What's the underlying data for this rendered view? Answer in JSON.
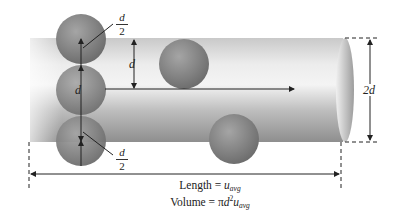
{
  "diagram": {
    "labels": {
      "d_half_top_num": "d",
      "d_half_top_den": "2",
      "d_vertical_center": "d",
      "d_spacing": "d",
      "d_half_bottom_num": "d",
      "d_half_bottom_den": "2",
      "diameter": "2d"
    },
    "caption": {
      "length_text": "Length = ",
      "length_var": "u",
      "length_sub": "avg",
      "volume_text": "Volume = ",
      "volume_pi": "π",
      "volume_d": "d",
      "volume_exp": "2",
      "volume_var": "u",
      "volume_sub": "avg"
    },
    "colors": {
      "cylinder_light": "#e6e6e6",
      "cylinder_dark": "#9a9a9a",
      "sphere": "#8a8a8a",
      "line": "#222222"
    }
  }
}
